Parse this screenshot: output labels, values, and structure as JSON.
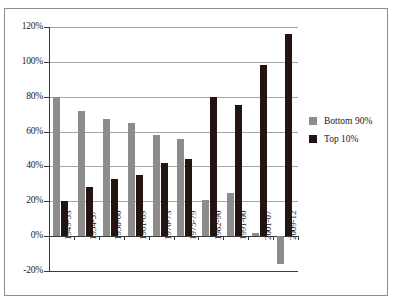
{
  "chart_data": {
    "type": "bar",
    "title": "",
    "subtitle": "",
    "xlabel": "",
    "ylabel": "",
    "ylim": [
      -20,
      120
    ],
    "yticks": [
      "-20%",
      "0%",
      "20%",
      "40%",
      "60%",
      "80%",
      "100%",
      "120%"
    ],
    "ytick_values": [
      -20,
      0,
      20,
      40,
      60,
      80,
      100,
      120
    ],
    "grid": true,
    "legend_position": "right",
    "categories": [
      "1949-53",
      "1954-57",
      "1958-60",
      "1961-69",
      "1970-73",
      "1975-79",
      "1982-90",
      "1991-00",
      "2001-07",
      "2009-12"
    ],
    "series": [
      {
        "name": "Bottom 90%",
        "color": "#8c8c8c",
        "values": [
          80,
          72,
          67,
          65,
          58,
          56,
          21,
          25,
          2,
          -16
        ]
      },
      {
        "name": "Top 10%",
        "color": "#231411",
        "values": [
          20,
          28,
          33,
          35,
          42,
          44,
          80,
          75,
          98,
          116
        ]
      }
    ]
  },
  "legend": {
    "items": [
      {
        "label": "Bottom 90%",
        "color": "#8c8c8c"
      },
      {
        "label": "Top 10%",
        "color": "#231411"
      }
    ]
  },
  "colors": {
    "bottom90": "#8c8c8c",
    "top10": "#231411",
    "grid": "#a8a8a8",
    "axis": "#3a3a3a",
    "frame": "#8d8d8d",
    "background": "#ffffff"
  }
}
